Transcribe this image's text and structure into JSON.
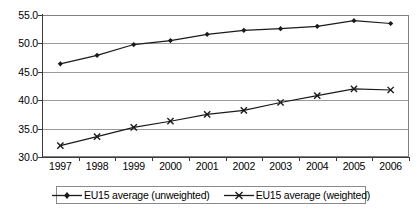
{
  "chart_data": {
    "type": "line",
    "title": "",
    "xlabel": "",
    "ylabel": "",
    "grid": true,
    "legend_position": "bottom",
    "categories": [
      "1997",
      "1998",
      "1999",
      "2000",
      "2001",
      "2002",
      "2003",
      "2004",
      "2005",
      "2006"
    ],
    "x": [
      1997,
      1998,
      1999,
      2000,
      2001,
      2002,
      2003,
      2004,
      2005,
      2006
    ],
    "ylim": [
      30.0,
      55.0
    ],
    "ytick_labels": [
      "55.0",
      "50.0",
      "45.0",
      "40.0",
      "35.0",
      "30.0"
    ],
    "yticks": [
      55.0,
      50.0,
      45.0,
      40.0,
      35.0,
      30.0
    ],
    "series": [
      {
        "name": "EU15 average (unweighted)",
        "marker": "diamond",
        "color": "#1a1a1a",
        "values": [
          46.4,
          47.9,
          49.8,
          50.5,
          51.6,
          52.3,
          52.6,
          53.0,
          54.0,
          53.5
        ]
      },
      {
        "name": "EU15 average (weighted)",
        "marker": "x",
        "color": "#1a1a1a",
        "values": [
          32.0,
          33.6,
          35.2,
          36.3,
          37.5,
          38.2,
          39.6,
          40.8,
          42.0,
          41.8
        ]
      }
    ]
  },
  "legend": {
    "entries": [
      {
        "label": "EU15 average (unweighted)",
        "marker": "diamond-marker-icon"
      },
      {
        "label": "EU15 average (weighted)",
        "marker": "x-marker-icon"
      }
    ]
  }
}
